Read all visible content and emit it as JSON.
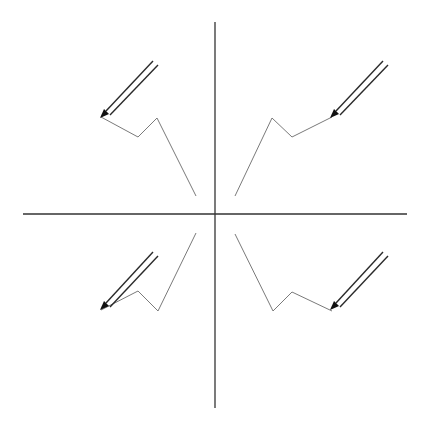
{
  "diagram": {
    "colors": {
      "background": "#ffffff",
      "axis": "#333333",
      "path": "#7a7a7a",
      "pencil": "#2a2a2a",
      "pencil_tip": "#111111"
    },
    "axes": {
      "horizontal": {
        "x1": 23,
        "y1": 214,
        "x2": 407,
        "y2": 214
      },
      "vertical": {
        "x1": 215,
        "y1": 22,
        "x2": 215,
        "y2": 408
      }
    },
    "quadrants": [
      {
        "name": "top-left",
        "path_points": "101,117 138,137 157,118 196,196",
        "pencil": {
          "line1": {
            "x1": 106,
            "y1": 111,
            "x2": 153,
            "y2": 61
          },
          "line2": {
            "x1": 110,
            "y1": 115,
            "x2": 158,
            "y2": 65
          },
          "tip": "100,118 104,109 109,114"
        }
      },
      {
        "name": "top-right",
        "path_points": "235,196 272,118 292,137 332,117",
        "pencil": {
          "line1": {
            "x1": 336,
            "y1": 111,
            "x2": 383,
            "y2": 61
          },
          "line2": {
            "x1": 340,
            "y1": 115,
            "x2": 388,
            "y2": 65
          },
          "tip": "330,118 334,109 339,114"
        }
      },
      {
        "name": "bottom-left",
        "path_points": "101,310 138,291 158,311 196,233",
        "pencil": {
          "line1": {
            "x1": 106,
            "y1": 303,
            "x2": 153,
            "y2": 252
          },
          "line2": {
            "x1": 110,
            "y1": 307,
            "x2": 158,
            "y2": 256
          },
          "tip": "100,310 104,301 109,306"
        }
      },
      {
        "name": "bottom-right",
        "path_points": "235,234 273,311 292,292 332,311",
        "pencil": {
          "line1": {
            "x1": 336,
            "y1": 303,
            "x2": 383,
            "y2": 252
          },
          "line2": {
            "x1": 340,
            "y1": 307,
            "x2": 388,
            "y2": 256
          },
          "tip": "330,310 334,301 339,306"
        }
      }
    ]
  }
}
